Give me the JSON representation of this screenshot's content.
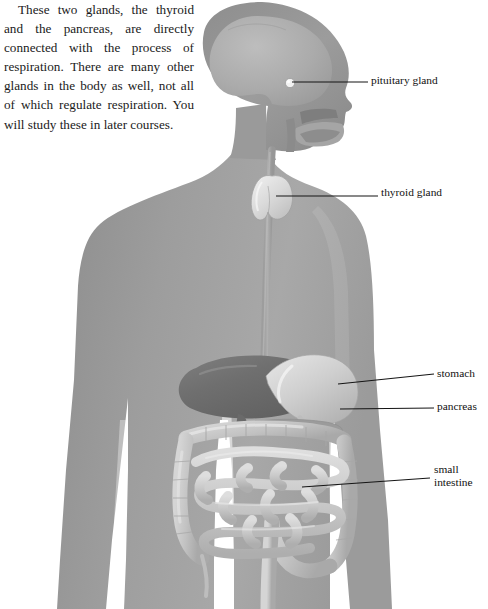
{
  "page": {
    "clipped_top_line": "in respiration.",
    "paragraph": "These two glands, the thyroid and the pancreas, are directly connected with the process of respiration. There are many other glands in the body as well, not all of which regulate respiration. You will study these in later courses."
  },
  "figure": {
    "caption": "",
    "labels": [
      {
        "id": "pituitary",
        "text": "pituitary gland"
      },
      {
        "id": "thyroid",
        "text": "thyroid gland"
      },
      {
        "id": "stomach",
        "text": "stomach"
      },
      {
        "id": "pancreas",
        "text": "pancreas"
      },
      {
        "id": "small_intestine",
        "text": "small\nintestine"
      }
    ],
    "organs": [
      "brain",
      "pituitary-gland",
      "nasal-cavity",
      "oral-cavity",
      "tongue",
      "trachea",
      "thyroid-gland",
      "esophagus",
      "liver",
      "stomach",
      "pancreas",
      "transverse-colon",
      "ascending-colon",
      "descending-colon",
      "small-intestine",
      "appendix",
      "sigmoid-colon",
      "rectum"
    ],
    "colors": {
      "body_silhouette": "#9a9a9a",
      "body_silhouette_light": "#b4b4b4",
      "skull_outline": "#8a8a8a",
      "brain": "#a9a9a9",
      "liver": "#6e6e6e",
      "stomach": "#c8c8c8",
      "intestine": "#c9c9c9",
      "leader_line": "#1a1a1a",
      "background": "#ffffff",
      "text": "#111111"
    }
  }
}
